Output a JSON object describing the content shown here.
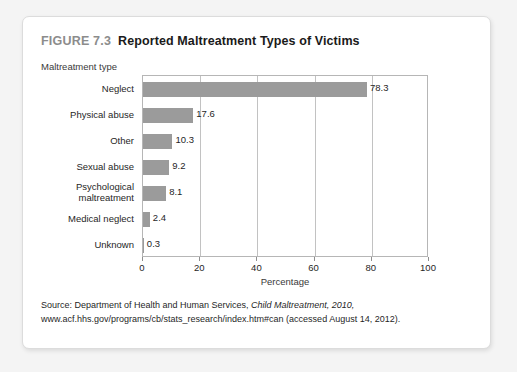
{
  "figure": {
    "number": "FIGURE 7.3",
    "title": "Reported Maltreatment Types of Victims"
  },
  "source": {
    "prefix": "Source: Department of Health and Human Services, ",
    "italic": "Child Maltreatment, 2010,",
    "suffix": " www.acf.hhs.gov/programs/cb/stats_research/index.htm#can (accessed August 14, 2012)."
  },
  "colors": {
    "bar": "#9b9b9b",
    "figure_number": "#8c8c8c",
    "title": "#1a1a1a",
    "card_background": "#ffffff",
    "page_background": "#f4f4f4",
    "gridline": "#c2c2c2",
    "plot_border": "#b6b6b6"
  },
  "chart_data": {
    "type": "bar",
    "orientation": "horizontal",
    "title": "Reported Maltreatment Types of Victims",
    "xlabel": "Percentage",
    "ylabel": "Maltreatment type",
    "categories": [
      "Neglect",
      "Physical abuse",
      "Other",
      "Sexual abuse",
      "Psychological maltreatment",
      "Medical neglect",
      "Unknown"
    ],
    "values": [
      78.3,
      17.6,
      10.3,
      9.2,
      8.1,
      2.4,
      0.3
    ],
    "value_labels": [
      "78.3",
      "17.6",
      "10.3",
      "9.2",
      "8.1",
      "2.4",
      "0.3"
    ],
    "xlim": [
      0,
      100
    ],
    "xticks": [
      0,
      20,
      40,
      60,
      80,
      100
    ],
    "xtick_labels": [
      "0",
      "20",
      "40",
      "60",
      "80",
      "100"
    ],
    "grid": "vertical",
    "legend": "none"
  }
}
